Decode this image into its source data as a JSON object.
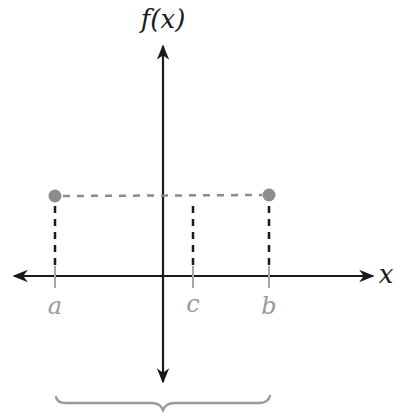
{
  "diagram": {
    "y_axis_label": "f(x)",
    "x_axis_label": "x",
    "points": [
      {
        "label": "a",
        "x": 55
      },
      {
        "label": "c",
        "x": 193
      },
      {
        "label": "b",
        "x": 269
      }
    ],
    "endpoints": [
      {
        "name": "f(a)",
        "cx": 55,
        "cy": 196
      },
      {
        "name": "f(b)",
        "cx": 269,
        "cy": 195
      }
    ],
    "colors": {
      "axis": "#1a1a1a",
      "point_gray": "#8c8c8c",
      "dashed_horizontal": "#8c8c8c",
      "dashed_vertical": "#1a1a1a",
      "tick_gray": "#a6a6a6",
      "label_gray": "#9a9a9a",
      "brace": "#9a9a9a"
    }
  }
}
